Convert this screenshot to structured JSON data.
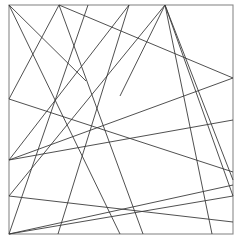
{
  "figure": {
    "title": "",
    "background_color": "#ffffff",
    "width": 242,
    "height": 242
  },
  "chart_data": {
    "type": "line",
    "title": "",
    "subtitle": "",
    "xlabel": "",
    "ylabel": "",
    "grid": false,
    "legend": null,
    "xlim": [
      0,
      242
    ],
    "ylim": [
      0,
      242
    ],
    "frame": {
      "name": "bounding-square",
      "x": 9,
      "y": 5,
      "width": 224,
      "height": 229,
      "stroke": "#8a8a8a",
      "stroke_width": 1.1
    },
    "stroke_color": "#3c3c3c",
    "stroke_width": 0.9,
    "segment_count": 19,
    "segments": [
      {
        "id": "s1",
        "x1": 9,
        "y1": 5,
        "x2": 86,
        "y2": 81,
        "label": "top-left-corner to mid-upper"
      },
      {
        "id": "s2",
        "x1": 9,
        "y1": 5,
        "x2": 120,
        "y2": 234,
        "label": "top-left-corner to bottom-mid"
      },
      {
        "id": "s3",
        "x1": 59,
        "y1": 5,
        "x2": 9,
        "y2": 99,
        "label": "top-edge-a to left-edge-a"
      },
      {
        "id": "s4",
        "x1": 59,
        "y1": 5,
        "x2": 143,
        "y2": 234,
        "label": "top-edge-a to bottom-edge-b"
      },
      {
        "id": "s5",
        "x1": 59,
        "y1": 5,
        "x2": 233,
        "y2": 78,
        "label": "top-edge-a to right-edge-a"
      },
      {
        "id": "s6",
        "x1": 129,
        "y1": 5,
        "x2": 9,
        "y2": 160,
        "label": "top-edge-b to left-edge-b"
      },
      {
        "id": "s7",
        "x1": 129,
        "y1": 5,
        "x2": 58,
        "y2": 234,
        "label": "top-edge-b to bottom-edge-a"
      },
      {
        "id": "s8",
        "x1": 165,
        "y1": 5,
        "x2": 9,
        "y2": 196,
        "label": "top-hub to left-edge-c"
      },
      {
        "id": "s9",
        "x1": 165,
        "y1": 5,
        "x2": 120,
        "y2": 96,
        "label": "top-hub short spur"
      },
      {
        "id": "s10",
        "x1": 165,
        "y1": 5,
        "x2": 212,
        "y2": 234,
        "label": "top-hub to bottom-right"
      },
      {
        "id": "s11",
        "x1": 165,
        "y1": 5,
        "x2": 233,
        "y2": 196,
        "label": "top-hub to right-edge-d"
      },
      {
        "id": "s12",
        "x1": 165,
        "y1": 5,
        "x2": 233,
        "y2": 180,
        "label": "top-hub to right-edge-c"
      },
      {
        "id": "s13",
        "x1": 9,
        "y1": 99,
        "x2": 233,
        "y2": 172,
        "label": "left-edge-a to right-edge-b"
      },
      {
        "id": "s14",
        "x1": 9,
        "y1": 160,
        "x2": 233,
        "y2": 78,
        "label": "left-edge-b to right-edge-a"
      },
      {
        "id": "s15",
        "x1": 9,
        "y1": 160,
        "x2": 233,
        "y2": 120,
        "label": "left-edge-b to right-mid"
      },
      {
        "id": "s16",
        "x1": 9,
        "y1": 196,
        "x2": 233,
        "y2": 222,
        "label": "left-edge-c to right-lower"
      },
      {
        "id": "s17",
        "x1": 9,
        "y1": 234,
        "x2": 88,
        "y2": 5,
        "label": "bottom-left-corner to top-edge"
      },
      {
        "id": "s18",
        "x1": 9,
        "y1": 234,
        "x2": 233,
        "y2": 185,
        "label": "bottom-left-corner to right-edge"
      },
      {
        "id": "s19",
        "x1": 9,
        "y1": 234,
        "x2": 233,
        "y2": 196,
        "label": "bottom-left-corner to right-edge-d"
      }
    ],
    "boundary_vertices": [
      {
        "name": "top-left-corner",
        "x": 9,
        "y": 5
      },
      {
        "name": "top-edge-a",
        "x": 59,
        "y": 5
      },
      {
        "name": "top-edge-c",
        "x": 88,
        "y": 5
      },
      {
        "name": "top-edge-b",
        "x": 129,
        "y": 5
      },
      {
        "name": "top-hub",
        "x": 165,
        "y": 5
      },
      {
        "name": "right-edge-a",
        "x": 233,
        "y": 78
      },
      {
        "name": "right-edge-mid",
        "x": 233,
        "y": 120
      },
      {
        "name": "right-edge-b",
        "x": 233,
        "y": 172
      },
      {
        "name": "right-edge-c",
        "x": 233,
        "y": 180
      },
      {
        "name": "right-edge-e",
        "x": 233,
        "y": 185
      },
      {
        "name": "right-edge-d",
        "x": 233,
        "y": 196
      },
      {
        "name": "right-edge-lower",
        "x": 233,
        "y": 222
      },
      {
        "name": "bottom-right-area",
        "x": 212,
        "y": 234
      },
      {
        "name": "bottom-edge-b",
        "x": 143,
        "y": 234
      },
      {
        "name": "bottom-edge-mid",
        "x": 120,
        "y": 234
      },
      {
        "name": "bottom-edge-a",
        "x": 58,
        "y": 234
      },
      {
        "name": "bottom-left-corner",
        "x": 9,
        "y": 234
      },
      {
        "name": "left-edge-c",
        "x": 9,
        "y": 196
      },
      {
        "name": "left-edge-b",
        "x": 9,
        "y": 160
      },
      {
        "name": "left-edge-a",
        "x": 9,
        "y": 99
      }
    ]
  }
}
